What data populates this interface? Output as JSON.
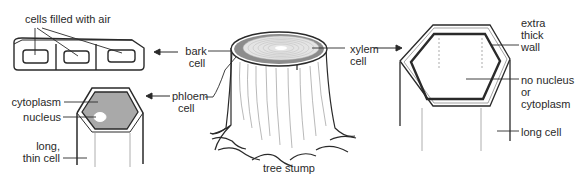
{
  "diagram": {
    "title": "",
    "labels": {
      "cells_filled_with_air": "cells filled with air",
      "bark_cell_1": "bark",
      "bark_cell_2": "cell",
      "xylem_cell_1": "xylem",
      "xylem_cell_2": "cell",
      "phloem_cell_1": "phloem",
      "phloem_cell_2": "cell",
      "cytoplasm": "cytoplasm",
      "nucleus": "nucleus",
      "long_thin_cell_1": "long,",
      "long_thin_cell_2": "thin cell",
      "tree_stump": "tree stump",
      "extra_thick_wall_1": "extra",
      "extra_thick_wall_2": "thick",
      "extra_thick_wall_3": "wall",
      "no_nucleus_1": "no nucleus",
      "no_nucleus_2": "or",
      "no_nucleus_3": "cytoplasm",
      "long_cell": "long cell"
    },
    "colors": {
      "stroke": "#2a2a2a",
      "cytoplasm_fill": "#a9a9a9",
      "bark_ring": "#8c8c8c",
      "xylem_rings": "#d0d0d0"
    }
  }
}
